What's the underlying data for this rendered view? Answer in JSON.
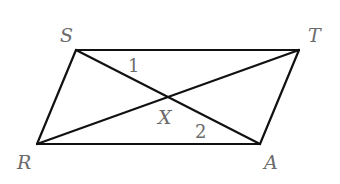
{
  "diagram": {
    "type": "parallelogram-with-diagonals",
    "colors": {
      "line": "#111111",
      "label": "#6b6b6b",
      "background": "#ffffff"
    },
    "vertices": {
      "S": {
        "x": 76,
        "y": 50
      },
      "T": {
        "x": 299,
        "y": 50
      },
      "A": {
        "x": 260,
        "y": 144
      },
      "R": {
        "x": 37,
        "y": 144
      },
      "X": {
        "x": 168,
        "y": 97
      }
    },
    "edges": [
      {
        "from": "S",
        "to": "T"
      },
      {
        "from": "T",
        "to": "A"
      },
      {
        "from": "A",
        "to": "R"
      },
      {
        "from": "R",
        "to": "S"
      },
      {
        "from": "S",
        "to": "A"
      },
      {
        "from": "R",
        "to": "T"
      }
    ],
    "labels": {
      "S": {
        "text": "S",
        "x": 60,
        "y": 42
      },
      "T": {
        "text": "T",
        "x": 308,
        "y": 42
      },
      "R": {
        "text": "R",
        "x": 17,
        "y": 169
      },
      "A": {
        "text": "A",
        "x": 264,
        "y": 169
      },
      "X": {
        "text": "X",
        "x": 158,
        "y": 124
      }
    },
    "angle_labels": {
      "angle1": {
        "text": "1",
        "x": 128,
        "y": 72
      },
      "angle2": {
        "text": "2",
        "x": 195,
        "y": 138
      }
    }
  }
}
